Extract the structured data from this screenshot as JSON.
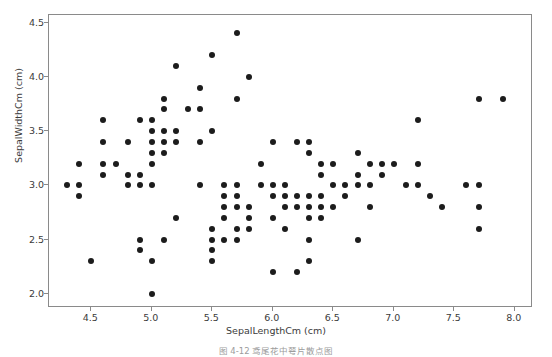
{
  "figure": {
    "caption": "图 4-12  鸢尾花中萼片散点图"
  },
  "axes": {
    "x_label": "SepalLengthCm  (cm)",
    "y_label": "SepalWidthCm  (cm)",
    "x_ticks": [
      "4.5",
      "5.0",
      "5.5",
      "6.0",
      "6.5",
      "7.0",
      "7.5",
      "8.0"
    ],
    "y_ticks": [
      "2.0",
      "2.5",
      "3.0",
      "3.5",
      "4.0",
      "4.5"
    ]
  },
  "chart_data": {
    "type": "scatter",
    "title": "",
    "xlabel": "SepalLengthCm  (cm)",
    "ylabel": "SepalWidthCm  (cm)",
    "xlim": [
      4.15,
      8.15
    ],
    "ylim": [
      1.87,
      4.57
    ],
    "xticks": [
      4.5,
      5.0,
      5.5,
      6.0,
      6.5,
      7.0,
      7.5,
      8.0
    ],
    "yticks": [
      2.0,
      2.5,
      3.0,
      3.5,
      4.0,
      4.5
    ],
    "grid": false,
    "legend": null,
    "marker_color": "#1c1c1c",
    "marker_size": 6,
    "series": [
      {
        "name": "Iris sepal measurements",
        "x": [
          5.1,
          4.9,
          4.7,
          4.6,
          5.0,
          5.4,
          4.6,
          5.0,
          4.4,
          4.9,
          5.4,
          4.8,
          4.8,
          4.3,
          5.8,
          5.7,
          5.4,
          5.1,
          5.7,
          5.1,
          5.4,
          5.1,
          4.6,
          5.1,
          4.8,
          5.0,
          5.0,
          5.2,
          5.2,
          4.7,
          4.8,
          5.4,
          5.2,
          5.5,
          4.9,
          5.0,
          5.5,
          4.9,
          4.4,
          5.1,
          5.0,
          4.5,
          4.4,
          5.0,
          5.1,
          4.8,
          5.1,
          4.6,
          5.3,
          5.0,
          7.0,
          6.4,
          6.9,
          5.5,
          6.5,
          5.7,
          6.3,
          4.9,
          6.6,
          5.2,
          5.0,
          5.9,
          6.0,
          6.1,
          5.6,
          6.7,
          5.6,
          5.8,
          6.2,
          5.6,
          5.9,
          6.1,
          6.3,
          6.1,
          6.4,
          6.6,
          6.8,
          6.7,
          6.0,
          5.7,
          5.5,
          5.5,
          5.8,
          6.0,
          5.4,
          6.0,
          6.7,
          6.3,
          5.6,
          5.5,
          5.5,
          6.1,
          5.8,
          5.0,
          5.6,
          5.7,
          5.7,
          6.2,
          5.1,
          5.7,
          6.3,
          5.8,
          7.1,
          6.3,
          6.5,
          7.6,
          4.9,
          7.3,
          6.7,
          7.2,
          6.5,
          6.4,
          6.8,
          5.7,
          5.8,
          6.4,
          6.5,
          7.7,
          7.7,
          6.0,
          6.9,
          5.6,
          7.7,
          6.3,
          6.7,
          7.2,
          6.2,
          6.1,
          6.4,
          7.2,
          7.4,
          7.9,
          6.4,
          6.3,
          6.1,
          7.7,
          6.3,
          6.4,
          6.0,
          6.9,
          6.7,
          6.9,
          5.8,
          6.8,
          6.7,
          6.7,
          6.3,
          6.5,
          6.2,
          5.9
        ],
        "y": [
          3.5,
          3.0,
          3.2,
          3.1,
          3.6,
          3.9,
          3.4,
          3.4,
          2.9,
          3.1,
          3.7,
          3.4,
          3.0,
          3.0,
          4.0,
          4.4,
          3.9,
          3.5,
          3.8,
          3.8,
          3.4,
          3.7,
          3.6,
          3.3,
          3.4,
          3.0,
          3.4,
          3.5,
          3.4,
          3.2,
          3.1,
          3.4,
          4.1,
          4.2,
          3.1,
          3.2,
          3.5,
          3.6,
          3.0,
          3.4,
          3.5,
          2.3,
          3.2,
          3.5,
          3.8,
          3.0,
          3.8,
          3.2,
          3.7,
          3.3,
          3.2,
          3.2,
          3.1,
          2.3,
          2.8,
          2.8,
          3.3,
          2.4,
          2.9,
          2.7,
          2.0,
          3.0,
          2.2,
          2.9,
          2.9,
          3.1,
          3.0,
          2.7,
          2.2,
          2.5,
          3.2,
          2.8,
          2.5,
          2.8,
          2.9,
          3.0,
          2.8,
          3.0,
          2.9,
          2.6,
          2.4,
          2.4,
          2.7,
          2.7,
          3.0,
          3.4,
          3.1,
          2.3,
          3.0,
          2.5,
          2.6,
          3.0,
          2.6,
          2.3,
          2.7,
          3.0,
          2.9,
          2.9,
          2.5,
          2.8,
          3.3,
          2.7,
          3.0,
          2.9,
          3.0,
          3.0,
          2.5,
          2.9,
          2.5,
          3.6,
          3.2,
          2.7,
          3.0,
          2.5,
          2.8,
          3.2,
          3.0,
          3.8,
          2.6,
          2.2,
          3.2,
          2.8,
          2.8,
          2.7,
          3.3,
          3.2,
          2.8,
          3.0,
          2.8,
          3.0,
          2.8,
          3.8,
          2.8,
          2.8,
          2.6,
          3.0,
          3.4,
          3.1,
          3.0,
          3.1,
          3.1,
          3.1,
          2.7,
          3.2,
          3.3,
          3.0,
          2.5,
          3.0,
          3.4,
          3.0
        ]
      }
    ]
  }
}
